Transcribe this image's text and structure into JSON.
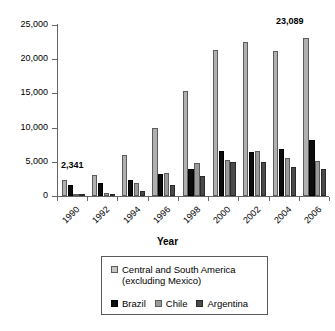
{
  "chart_data": {
    "type": "bar",
    "title": "",
    "subtitle": "",
    "xlabel": "Year",
    "ylabel": "",
    "categories": [
      "1990",
      "1992",
      "1994",
      "1996",
      "1998",
      "2000",
      "2002",
      "2004",
      "2006"
    ],
    "ylim": [
      0,
      25000
    ],
    "ytick_labels": [
      "0",
      "5,000",
      "10,000",
      "15,000",
      "20,000",
      "25,000"
    ],
    "ytick_values": [
      0,
      5000,
      10000,
      15000,
      20000,
      25000
    ],
    "grid": false,
    "legend_position": "below-axes",
    "series": [
      {
        "name": "Central and South America\n(excluding Mexico)",
        "color": "#b0b0b0",
        "values": [
          2341,
          3100,
          5950,
          9900,
          15300,
          21300,
          22500,
          21150,
          23089
        ]
      },
      {
        "name": "Brazil",
        "color": "#0d0d0d",
        "values": [
          1650,
          1850,
          2300,
          3200,
          3900,
          6600,
          6500,
          6900,
          8200
        ]
      },
      {
        "name": "Chile",
        "color": "#9a9a9a",
        "values": [
          250,
          450,
          1900,
          3300,
          4800,
          5300,
          6550,
          5550,
          5150
        ]
      },
      {
        "name": "Argentina",
        "color": "#4a4a4a",
        "values": [
          150,
          180,
          700,
          1650,
          2950,
          4900,
          4950,
          4300,
          3950
        ]
      }
    ],
    "annotations": [
      {
        "text": "2,341",
        "category": "1990",
        "series": "Central and South America (excluding Mexico)",
        "value": 2341
      },
      {
        "text": "23,089",
        "category": "2006",
        "series": "Central and South America (excluding Mexico)",
        "value": 23089
      }
    ]
  },
  "legend": {
    "entries": [
      {
        "label": "Central and South America\n(excluding Mexico)",
        "swatch": "s0"
      },
      {
        "label": "Brazil",
        "swatch": "s1"
      },
      {
        "label": "Chile",
        "swatch": "s2"
      },
      {
        "label": "Argentina",
        "swatch": "s3"
      }
    ]
  },
  "axis": {
    "x_title": "Year"
  }
}
